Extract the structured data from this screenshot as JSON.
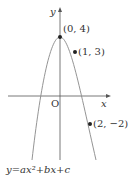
{
  "figure": {
    "axis_labels": {
      "x": "x",
      "y": "y",
      "origin": "O"
    },
    "points": [
      {
        "name": "vertex",
        "label": "(0, 4)",
        "x": 0,
        "y": 4
      },
      {
        "name": "point-1-3",
        "label": "(1, 3)",
        "x": 1,
        "y": 3
      },
      {
        "name": "point-2-neg2",
        "label": "(2, −2)",
        "x": 2,
        "y": -2
      }
    ],
    "equation": "y=ax²+bx+c",
    "colors": {
      "curve": "#888888",
      "axes": "#555555",
      "points": "#222222"
    }
  }
}
